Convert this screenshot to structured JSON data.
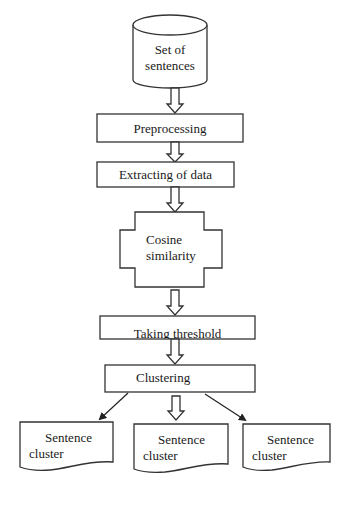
{
  "diagram": {
    "type": "flowchart",
    "nodes": [
      {
        "id": "set_of_sentences",
        "shape": "cylinder",
        "label_line1": "Set of",
        "label_line2": "sentences"
      },
      {
        "id": "preprocessing",
        "shape": "rectangle",
        "label": "Preprocessing"
      },
      {
        "id": "extracting_of_data",
        "shape": "rectangle",
        "label": "Extracting of data"
      },
      {
        "id": "cosine_similarity",
        "shape": "cross",
        "label_line1": "Cosine",
        "label_line2": "similarity"
      },
      {
        "id": "taking_threshold",
        "shape": "rectangle",
        "label": "Taking threshold"
      },
      {
        "id": "clustering",
        "shape": "rectangle",
        "label": "Clustering"
      },
      {
        "id": "sentence_cluster_1",
        "shape": "document",
        "label_line1": "Sentence",
        "label_line2": "cluster"
      },
      {
        "id": "sentence_cluster_2",
        "shape": "document",
        "label_line1": "Sentence",
        "label_line2": "cluster"
      },
      {
        "id": "sentence_cluster_3",
        "shape": "document",
        "label_line1": "Sentence",
        "label_line2": "cluster"
      }
    ],
    "edges": [
      {
        "from": "set_of_sentences",
        "to": "preprocessing",
        "style": "hollow-block-arrow"
      },
      {
        "from": "preprocessing",
        "to": "extracting_of_data",
        "style": "hollow-block-arrow"
      },
      {
        "from": "extracting_of_data",
        "to": "cosine_similarity",
        "style": "hollow-block-arrow"
      },
      {
        "from": "cosine_similarity",
        "to": "taking_threshold",
        "style": "hollow-block-arrow"
      },
      {
        "from": "taking_threshold",
        "to": "clustering",
        "style": "hollow-block-arrow"
      },
      {
        "from": "clustering",
        "to": "sentence_cluster_1",
        "style": "solid-line-arrow"
      },
      {
        "from": "clustering",
        "to": "sentence_cluster_2",
        "style": "hollow-block-arrow"
      },
      {
        "from": "clustering",
        "to": "sentence_cluster_3",
        "style": "solid-line-arrow"
      }
    ]
  },
  "colors": {
    "stroke": "#333333",
    "background": "#ffffff",
    "text": "#1a1a1a"
  }
}
